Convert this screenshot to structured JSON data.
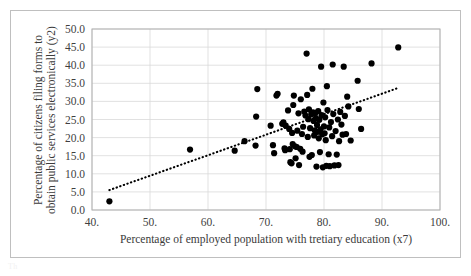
{
  "chart_data": {
    "type": "scatter",
    "title": "",
    "xlabel": "Percentage of employed population with tretiary education (x7)",
    "ylabel_line1": "Percentage of citizens filing forms to",
    "ylabel_line2": "obtain public services electronically (y2)",
    "xlim": [
      40,
      100
    ],
    "ylim": [
      0,
      50
    ],
    "xticks": [
      40,
      50,
      60,
      70,
      80,
      90,
      100
    ],
    "xtick_labels": [
      "40.",
      "50.",
      "60.",
      "70.",
      "80.",
      "90.",
      "100."
    ],
    "yticks": [
      0,
      5,
      10,
      15,
      20,
      25,
      30,
      35,
      40,
      45,
      50
    ],
    "ytick_labels": [
      "0.0",
      "5.0",
      "10.0",
      "15.0",
      "20.0",
      "25.0",
      "30.0",
      "35.0",
      "40.0",
      "45.0",
      "50.0"
    ],
    "grid": {
      "horizontal": true,
      "vertical": true,
      "color": "#d9d9d9"
    },
    "legend": null,
    "marker": {
      "shape": "circle",
      "color": "#000000",
      "size": 6.2
    },
    "trendline": {
      "type": "dotted-linear",
      "color": "#000000",
      "x_start": 43.0,
      "y_start": 5.5,
      "x_end": 92.6,
      "y_end": 33.6
    },
    "points": [
      [
        43.0,
        2.4
      ],
      [
        56.9,
        16.7
      ],
      [
        64.6,
        16.4
      ],
      [
        66.3,
        19.0
      ],
      [
        68.2,
        17.8
      ],
      [
        68.3,
        25.8
      ],
      [
        68.5,
        33.4
      ],
      [
        70.8,
        23.3
      ],
      [
        71.2,
        17.9
      ],
      [
        71.4,
        15.7
      ],
      [
        71.8,
        31.6
      ],
      [
        72.0,
        32.1
      ],
      [
        72.8,
        23.8
      ],
      [
        73.0,
        24.2
      ],
      [
        73.2,
        17.0
      ],
      [
        73.3,
        16.5
      ],
      [
        73.4,
        23.3
      ],
      [
        73.8,
        27.5
      ],
      [
        74.0,
        22.4
      ],
      [
        74.1,
        16.8
      ],
      [
        74.2,
        13.2
      ],
      [
        74.4,
        12.9
      ],
      [
        74.5,
        21.3
      ],
      [
        74.6,
        18.2
      ],
      [
        74.7,
        29.0
      ],
      [
        74.8,
        31.6
      ],
      [
        75.0,
        17.6
      ],
      [
        75.1,
        14.3
      ],
      [
        75.3,
        17.4
      ],
      [
        75.4,
        21.9
      ],
      [
        75.6,
        26.7
      ],
      [
        75.7,
        12.4
      ],
      [
        75.9,
        16.9
      ],
      [
        76.0,
        30.6
      ],
      [
        76.2,
        21.0
      ],
      [
        76.3,
        16.1
      ],
      [
        76.4,
        23.0
      ],
      [
        76.6,
        27.2
      ],
      [
        76.8,
        26.1
      ],
      [
        77.0,
        43.2
      ],
      [
        77.1,
        31.8
      ],
      [
        77.2,
        20.2
      ],
      [
        77.3,
        25.1
      ],
      [
        77.4,
        27.8
      ],
      [
        77.5,
        14.7
      ],
      [
        77.6,
        22.6
      ],
      [
        77.8,
        26.4
      ],
      [
        77.9,
        15.2
      ],
      [
        78.0,
        33.5
      ],
      [
        78.1,
        27.0
      ],
      [
        78.2,
        24.6
      ],
      [
        78.3,
        20.6
      ],
      [
        78.4,
        22.0
      ],
      [
        78.5,
        26.8
      ],
      [
        78.6,
        25.3
      ],
      [
        78.7,
        12.0
      ],
      [
        78.8,
        23.5
      ],
      [
        78.9,
        21.6
      ],
      [
        79.0,
        27.3
      ],
      [
        79.1,
        19.8
      ],
      [
        79.2,
        24.9
      ],
      [
        79.3,
        16.0
      ],
      [
        79.4,
        22.3
      ],
      [
        79.5,
        39.6
      ],
      [
        79.6,
        26.2
      ],
      [
        79.7,
        20.9
      ],
      [
        79.8,
        11.8
      ],
      [
        79.9,
        29.7
      ],
      [
        80.0,
        23.1
      ],
      [
        80.1,
        21.2
      ],
      [
        80.2,
        25.6
      ],
      [
        80.3,
        19.3
      ],
      [
        80.4,
        12.2
      ],
      [
        80.5,
        34.2
      ],
      [
        80.6,
        27.6
      ],
      [
        80.8,
        15.4
      ],
      [
        80.9,
        22.8
      ],
      [
        81.0,
        12.1
      ],
      [
        81.2,
        24.3
      ],
      [
        81.4,
        20.4
      ],
      [
        81.5,
        40.2
      ],
      [
        81.6,
        26.5
      ],
      [
        81.8,
        12.3
      ],
      [
        82.0,
        21.8
      ],
      [
        82.2,
        15.3
      ],
      [
        82.4,
        25.0
      ],
      [
        82.5,
        12.4
      ],
      [
        82.6,
        19.0
      ],
      [
        82.8,
        27.1
      ],
      [
        83.0,
        23.6
      ],
      [
        83.2,
        20.8
      ],
      [
        83.4,
        39.6
      ],
      [
        83.6,
        26.0
      ],
      [
        83.8,
        21.0
      ],
      [
        84.0,
        31.3
      ],
      [
        84.2,
        28.6
      ],
      [
        84.6,
        19.2
      ],
      [
        85.8,
        35.7
      ],
      [
        86.0,
        27.9
      ],
      [
        86.4,
        22.4
      ],
      [
        88.2,
        40.5
      ],
      [
        92.8,
        44.9
      ]
    ]
  },
  "artifact": {
    "text": "Th"
  }
}
